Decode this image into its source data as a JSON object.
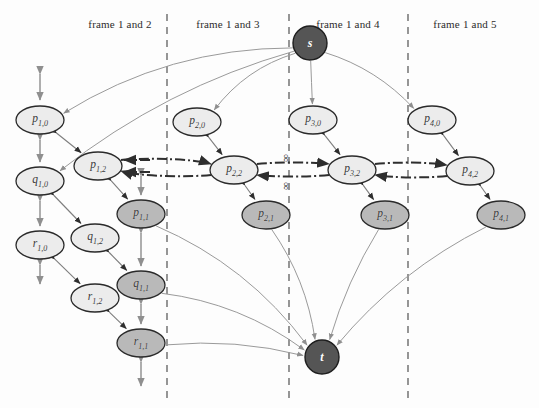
{
  "diagram": {
    "colors": {
      "node_light": "#ececec",
      "node_mid": "#b9b9b9",
      "node_terminal": "#555555",
      "node_stroke": "#2a2a2a",
      "edge_gray": "#9a9a9a",
      "edge_dark": "#2e2e2e",
      "divider": "#7c7c7c",
      "label_text": "#2b2b2b"
    },
    "frame_labels": [
      {
        "text": "frame 1 and 2",
        "x": 120,
        "y": 24
      },
      {
        "text": "frame 1 and 3",
        "x": 228,
        "y": 24
      },
      {
        "text": "frame 1 and 4",
        "x": 348,
        "y": 24
      },
      {
        "text": "frame 1 and 5",
        "x": 465,
        "y": 24
      }
    ],
    "dividers": [
      {
        "x": 167,
        "y1": 14,
        "y2": 398
      },
      {
        "x": 289,
        "y1": 14,
        "y2": 398
      },
      {
        "x": 408,
        "y1": 14,
        "y2": 398
      }
    ],
    "infinity_labels": [
      {
        "text": "∞",
        "x": 285,
        "y": 158
      },
      {
        "text": "∞",
        "x": 285,
        "y": 186
      }
    ],
    "terminals": [
      {
        "id": "s",
        "label": "s",
        "x": 310,
        "y": 43,
        "r": 17
      },
      {
        "id": "t",
        "label": "t",
        "x": 322,
        "y": 357,
        "r": 17
      }
    ],
    "nodes": [
      {
        "id": "p10",
        "base": "p",
        "sub": "1,0",
        "x": 40,
        "y": 120,
        "rx": 24,
        "ry": 14,
        "shade": "light"
      },
      {
        "id": "q10",
        "base": "q",
        "sub": "1,0",
        "x": 40,
        "y": 181,
        "rx": 24,
        "ry": 14,
        "shade": "light"
      },
      {
        "id": "r10",
        "base": "r",
        "sub": "1,0",
        "x": 40,
        "y": 245,
        "rx": 24,
        "ry": 14,
        "shade": "light"
      },
      {
        "id": "p12",
        "base": "p",
        "sub": "1,2",
        "x": 98,
        "y": 166,
        "rx": 24,
        "ry": 14,
        "shade": "light"
      },
      {
        "id": "q12",
        "base": "q",
        "sub": "1,2",
        "x": 95,
        "y": 238,
        "rx": 24,
        "ry": 14,
        "shade": "light"
      },
      {
        "id": "r12",
        "base": "r",
        "sub": "1,2",
        "x": 95,
        "y": 298,
        "rx": 24,
        "ry": 14,
        "shade": "light"
      },
      {
        "id": "p11",
        "base": "p",
        "sub": "1,1",
        "x": 141,
        "y": 214,
        "rx": 24,
        "ry": 14,
        "shade": "mid"
      },
      {
        "id": "q11",
        "base": "q",
        "sub": "1,1",
        "x": 141,
        "y": 285,
        "rx": 24,
        "ry": 14,
        "shade": "mid"
      },
      {
        "id": "r11",
        "base": "r",
        "sub": "1,1",
        "x": 141,
        "y": 343,
        "rx": 24,
        "ry": 14,
        "shade": "mid"
      },
      {
        "id": "p20",
        "base": "p",
        "sub": "2,0",
        "x": 197,
        "y": 122,
        "rx": 24,
        "ry": 14,
        "shade": "light"
      },
      {
        "id": "p22",
        "base": "p",
        "sub": "2,2",
        "x": 234,
        "y": 170,
        "rx": 24,
        "ry": 14,
        "shade": "light"
      },
      {
        "id": "p21",
        "base": "p",
        "sub": "2,1",
        "x": 266,
        "y": 215,
        "rx": 24,
        "ry": 14,
        "shade": "mid"
      },
      {
        "id": "p30",
        "base": "p",
        "sub": "3,0",
        "x": 313,
        "y": 120,
        "rx": 24,
        "ry": 14,
        "shade": "light"
      },
      {
        "id": "p32",
        "base": "p",
        "sub": "3,2",
        "x": 352,
        "y": 170,
        "rx": 24,
        "ry": 14,
        "shade": "light"
      },
      {
        "id": "p31",
        "base": "p",
        "sub": "3,1",
        "x": 385,
        "y": 215,
        "rx": 24,
        "ry": 14,
        "shade": "mid"
      },
      {
        "id": "p40",
        "base": "p",
        "sub": "4,0",
        "x": 432,
        "y": 120,
        "rx": 24,
        "ry": 14,
        "shade": "light"
      },
      {
        "id": "p42",
        "base": "p",
        "sub": "4,2",
        "x": 470,
        "y": 171,
        "rx": 24,
        "ry": 14,
        "shade": "light"
      },
      {
        "id": "p41",
        "base": "p",
        "sub": "4,1",
        "x": 501,
        "y": 215,
        "rx": 24,
        "ry": 14,
        "shade": "mid"
      }
    ],
    "stub_arrows": [
      {
        "x": 40,
        "y1": 70,
        "y2": 104
      },
      {
        "x": 40,
        "y1": 136,
        "y2": 166
      },
      {
        "x": 40,
        "y1": 197,
        "y2": 230
      },
      {
        "x": 40,
        "y1": 261,
        "y2": 288
      },
      {
        "x": 141,
        "y1": 172,
        "y2": 199
      },
      {
        "x": 141,
        "y1": 229,
        "y2": 270
      },
      {
        "x": 141,
        "y1": 300,
        "y2": 328
      },
      {
        "x": 141,
        "y1": 358,
        "y2": 390
      }
    ],
    "chain_edges": [
      {
        "from": "p10",
        "to": "p12"
      },
      {
        "from": "p12",
        "to": "p11"
      },
      {
        "from": "q10",
        "to": "q12"
      },
      {
        "from": "q12",
        "to": "q11"
      },
      {
        "from": "r10",
        "to": "r12"
      },
      {
        "from": "r12",
        "to": "r11"
      },
      {
        "from": "p20",
        "to": "p22"
      },
      {
        "from": "p22",
        "to": "p21"
      },
      {
        "from": "p30",
        "to": "p32"
      },
      {
        "from": "p32",
        "to": "p31"
      },
      {
        "from": "p40",
        "to": "p42"
      },
      {
        "from": "p42",
        "to": "p41"
      }
    ],
    "dashdot_edges": [
      {
        "from": "p12",
        "to": "p22"
      },
      {
        "from": "p22",
        "to": "p32"
      },
      {
        "from": "p32",
        "to": "p42"
      }
    ],
    "source_edges": [
      {
        "from": "s",
        "to": "p10"
      },
      {
        "from": "s",
        "to": "q10"
      },
      {
        "from": "s",
        "to": "p20"
      },
      {
        "from": "s",
        "to": "p30"
      },
      {
        "from": "s",
        "to": "p40"
      }
    ],
    "sink_edges": [
      {
        "from": "p11",
        "to": "t"
      },
      {
        "from": "q11",
        "to": "t"
      },
      {
        "from": "r11",
        "to": "t"
      },
      {
        "from": "p21",
        "to": "t"
      },
      {
        "from": "p31",
        "to": "t"
      },
      {
        "from": "p41",
        "to": "t"
      }
    ]
  }
}
